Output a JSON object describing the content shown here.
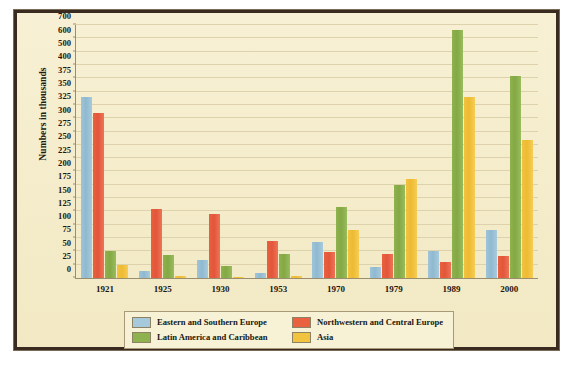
{
  "chart_data": {
    "type": "bar",
    "title": "",
    "xlabel": "",
    "ylabel": "Numbers in thousands",
    "categories": [
      "1921",
      "1925",
      "1930",
      "1953",
      "1970",
      "1979",
      "1989",
      "2000"
    ],
    "ytick_labels": [
      "0",
      "25",
      "50",
      "75",
      "100",
      "125",
      "150",
      "175",
      "200",
      "225",
      "250",
      "275",
      "300",
      "325",
      "350",
      "375",
      "400",
      "500",
      "600",
      "700"
    ],
    "ytick_values": [
      0,
      25,
      50,
      75,
      100,
      125,
      150,
      175,
      200,
      225,
      250,
      275,
      300,
      325,
      350,
      375,
      400,
      500,
      600,
      700
    ],
    "ylim": [
      0,
      700
    ],
    "grid": true,
    "axis_note": "non-linear y-axis: equal spacing per listed tick",
    "legend_position": "bottom",
    "series": [
      {
        "name": "Eastern and Southern Europe",
        "color": "#a6c9dc",
        "values": [
          340,
          13,
          33,
          9,
          68,
          20,
          50,
          91
        ]
      },
      {
        "name": "Northwestern and Central Europe",
        "color": "#e9613f",
        "values": [
          310,
          130,
          120,
          70,
          48,
          45,
          31,
          41
        ]
      },
      {
        "name": "Latin America and Caribbean",
        "color": "#8eb24e",
        "values": [
          50,
          43,
          22,
          45,
          133,
          174,
          665,
          380
        ]
      },
      {
        "name": "Asia",
        "color": "#f2c33f",
        "values": [
          25,
          3,
          1,
          4,
          90,
          186,
          340,
          260
        ]
      }
    ]
  },
  "legend": {
    "items": [
      {
        "label": "Eastern and Southern Europe",
        "swatch": "s0"
      },
      {
        "label": "Northwestern and Central Europe",
        "swatch": "s1"
      },
      {
        "label": "Latin America and Caribbean",
        "swatch": "s2"
      },
      {
        "label": "Asia",
        "swatch": "s3"
      }
    ]
  }
}
